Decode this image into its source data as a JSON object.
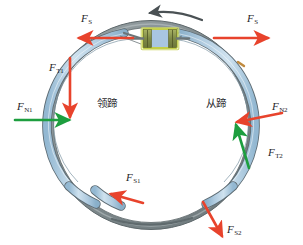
{
  "figure": {
    "kind": "drum-brake-force-diagram",
    "background_color": "#ffffff"
  },
  "components": {
    "drum": {
      "name": "brake-drum",
      "outer_color": "#8f9a9d",
      "inner_color": "#6f797c"
    },
    "shoes": {
      "leading_label": "领蹄",
      "trailing_label": "从蹄",
      "fill_color": "#b9d4e8",
      "edge_color": "#5d6b73"
    },
    "wheel_cylinder": {
      "name": "wheel-cylinder",
      "border_color": "#c3cf4a",
      "body_color": "#8f9a55",
      "window_color": "#a9c6e2"
    },
    "rotation_arrow": {
      "name": "drum-rotation-arrow",
      "direction": "counterclockwise",
      "color": "#4a5154"
    }
  },
  "forces": [
    {
      "id": "fs-left",
      "symbol": "F",
      "subscript": "S",
      "color": "#e8432c",
      "direction": "left",
      "description": "applied actuating force on leading shoe"
    },
    {
      "id": "fs-right",
      "symbol": "F",
      "subscript": "S",
      "color": "#e8432c",
      "direction": "right",
      "description": "applied actuating force on trailing shoe"
    },
    {
      "id": "ft1",
      "symbol": "F",
      "subscript": "T1",
      "color": "#e8432c",
      "direction": "down",
      "description": "friction force on leading shoe"
    },
    {
      "id": "fn1",
      "symbol": "F",
      "subscript": "N1",
      "color": "#1d9e3f",
      "direction": "right",
      "description": "normal force on leading shoe"
    },
    {
      "id": "fn2",
      "symbol": "F",
      "subscript": "N2",
      "color": "#e8432c",
      "direction": "left",
      "description": "normal force on trailing shoe"
    },
    {
      "id": "ft2",
      "symbol": "F",
      "subscript": "T2",
      "color": "#1d9e3f",
      "direction": "up",
      "description": "friction force on trailing shoe"
    },
    {
      "id": "fs1",
      "symbol": "F",
      "subscript": "S1",
      "color": "#e8432c",
      "direction": "up-left",
      "description": "reaction force at leading shoe pivot"
    },
    {
      "id": "fs2",
      "symbol": "F",
      "subscript": "S2",
      "color": "#e8432c",
      "direction": "down-right",
      "description": "reaction force at trailing shoe pivot"
    }
  ],
  "labels": {
    "fs_left": {
      "sym": "F",
      "sub": "S"
    },
    "fs_right": {
      "sym": "F",
      "sub": "S"
    },
    "ft1": {
      "sym": "F",
      "sub": "T1"
    },
    "fn1": {
      "sym": "F",
      "sub": "N1"
    },
    "fn2": {
      "sym": "F",
      "sub": "N2"
    },
    "ft2": {
      "sym": "F",
      "sub": "T2"
    },
    "fs1": {
      "sym": "F",
      "sub": "S1"
    },
    "fs2": {
      "sym": "F",
      "sub": "S2"
    },
    "leading_shoe": "领蹄",
    "trailing_shoe": "从蹄"
  }
}
